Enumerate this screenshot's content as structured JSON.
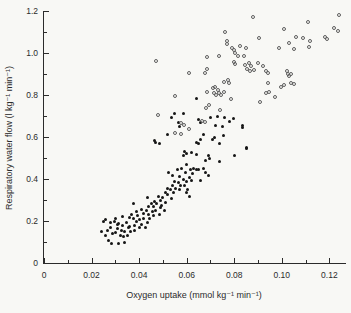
{
  "figure": {
    "background": "#f8f8f5",
    "axis_color": "#2b2b2b",
    "text_color": "#2b2b2b"
  },
  "chart_data": {
    "type": "scatter",
    "title": "",
    "xlabel": "Oxygen uptake (mmol kg⁻¹ min⁻¹)",
    "ylabel": "Respiratory water flow (l kg⁻¹ min⁻¹)",
    "grid": false,
    "legend": "none",
    "axes": {
      "x": {
        "min": 0,
        "max": 0.127,
        "major_ticks": [
          {
            "v": 0,
            "t": "0"
          },
          {
            "v": 0.02,
            "t": "0.02"
          },
          {
            "v": 0.04,
            "t": "0.04"
          },
          {
            "v": 0.06,
            "t": "0.06"
          },
          {
            "v": 0.08,
            "t": "0.08"
          },
          {
            "v": 0.1,
            "t": "0.10"
          },
          {
            "v": 0.12,
            "t": "0.12"
          }
        ],
        "minor_ticks": [
          0.01,
          0.03,
          0.05,
          0.07,
          0.09,
          0.11
        ]
      },
      "y": {
        "min": 0,
        "max": 1.2,
        "major_ticks": [
          {
            "v": 0,
            "t": "0"
          },
          {
            "v": 0.2,
            "t": "0.2"
          },
          {
            "v": 0.4,
            "t": "0.4"
          },
          {
            "v": 0.6,
            "t": "0.6"
          },
          {
            "v": 0.8,
            "t": "0.8"
          },
          {
            "v": 1.0,
            "t": "1.0"
          },
          {
            "v": 1.2,
            "t": "1.2"
          }
        ],
        "minor_ticks": [
          0.1,
          0.3,
          0.5,
          0.7,
          0.9,
          1.1
        ]
      }
    },
    "series": [
      {
        "name": "filled-circles",
        "marker": "filled-circle",
        "color": "#161616",
        "points": [
          [
            0.024,
            0.15
          ],
          [
            0.025,
            0.2
          ],
          [
            0.026,
            0.13
          ],
          [
            0.026,
            0.205
          ],
          [
            0.0265,
            0.155
          ],
          [
            0.027,
            0.105
          ],
          [
            0.028,
            0.17
          ],
          [
            0.028,
            0.195
          ],
          [
            0.0285,
            0.095
          ],
          [
            0.029,
            0.14
          ],
          [
            0.0295,
            0.2
          ],
          [
            0.03,
            0.21
          ],
          [
            0.03,
            0.143
          ],
          [
            0.031,
            0.165
          ],
          [
            0.031,
            0.185
          ],
          [
            0.0315,
            0.19
          ],
          [
            0.0315,
            0.095
          ],
          [
            0.032,
            0.133
          ],
          [
            0.0325,
            0.157
          ],
          [
            0.033,
            0.22
          ],
          [
            0.033,
            0.18
          ],
          [
            0.0335,
            0.125
          ],
          [
            0.034,
            0.098
          ],
          [
            0.034,
            0.152
          ],
          [
            0.0345,
            0.195
          ],
          [
            0.035,
            0.133
          ],
          [
            0.0355,
            0.167
          ],
          [
            0.036,
            0.215
          ],
          [
            0.036,
            0.175
          ],
          [
            0.0365,
            0.148
          ],
          [
            0.037,
            0.233
          ],
          [
            0.0375,
            0.21
          ],
          [
            0.0375,
            0.285
          ],
          [
            0.038,
            0.18
          ],
          [
            0.038,
            0.157
          ],
          [
            0.039,
            0.243
          ],
          [
            0.039,
            0.2
          ],
          [
            0.0395,
            0.225
          ],
          [
            0.04,
            0.17
          ],
          [
            0.04,
            0.205
          ],
          [
            0.041,
            0.257
          ],
          [
            0.041,
            0.185
          ],
          [
            0.042,
            0.238
          ],
          [
            0.042,
            0.214
          ],
          [
            0.0425,
            0.167
          ],
          [
            0.043,
            0.252
          ],
          [
            0.0435,
            0.195
          ],
          [
            0.0435,
            0.314
          ],
          [
            0.044,
            0.229
          ],
          [
            0.044,
            0.267
          ],
          [
            0.0445,
            0.21
          ],
          [
            0.045,
            0.281
          ],
          [
            0.0455,
            0.243
          ],
          [
            0.046,
            0.224
          ],
          [
            0.046,
            0.271
          ],
          [
            0.0465,
            0.295
          ],
          [
            0.047,
            0.252
          ],
          [
            0.0475,
            0.281
          ],
          [
            0.048,
            0.319
          ],
          [
            0.0485,
            0.233
          ],
          [
            0.049,
            0.262
          ],
          [
            0.049,
            0.3
          ],
          [
            0.0495,
            0.276
          ],
          [
            0.05,
            0.314
          ],
          [
            0.0505,
            0.252
          ],
          [
            0.051,
            0.338
          ],
          [
            0.051,
            0.29
          ],
          [
            0.052,
            0.357
          ],
          [
            0.052,
            0.324
          ],
          [
            0.0525,
            0.433
          ],
          [
            0.053,
            0.348
          ],
          [
            0.0535,
            0.305
          ],
          [
            0.054,
            0.367
          ],
          [
            0.054,
            0.419
          ],
          [
            0.0545,
            0.338
          ],
          [
            0.055,
            0.39
          ],
          [
            0.0555,
            0.357
          ],
          [
            0.056,
            0.443
          ],
          [
            0.0565,
            0.381
          ],
          [
            0.057,
            0.348
          ],
          [
            0.057,
            0.414
          ],
          [
            0.0575,
            0.367
          ],
          [
            0.058,
            0.452
          ],
          [
            0.0585,
            0.4
          ],
          [
            0.059,
            0.533
          ],
          [
            0.059,
            0.367
          ],
          [
            0.0595,
            0.429
          ],
          [
            0.06,
            0.467
          ],
          [
            0.06,
            0.386
          ],
          [
            0.0605,
            0.352
          ],
          [
            0.061,
            0.405
          ],
          [
            0.0615,
            0.443
          ],
          [
            0.062,
            0.524
          ],
          [
            0.062,
            0.395
          ],
          [
            0.0625,
            0.424
          ],
          [
            0.063,
            0.452
          ],
          [
            0.06,
            0.338
          ],
          [
            0.061,
            0.319
          ],
          [
            0.064,
            0.576
          ],
          [
            0.065,
            0.571
          ],
          [
            0.066,
            0.586
          ],
          [
            0.071,
            0.586
          ],
          [
            0.074,
            0.571
          ],
          [
            0.085,
            0.552
          ],
          [
            0.064,
            0.519
          ],
          [
            0.069,
            0.51
          ],
          [
            0.0695,
            0.5
          ],
          [
            0.068,
            0.49
          ],
          [
            0.08,
            0.514
          ],
          [
            0.074,
            0.481
          ],
          [
            0.064,
            0.443
          ],
          [
            0.065,
            0.443
          ],
          [
            0.067,
            0.452
          ],
          [
            0.068,
            0.433
          ],
          [
            0.069,
            0.419
          ],
          [
            0.066,
            0.395
          ],
          [
            0.064,
            0.785
          ],
          [
            0.055,
            0.714
          ],
          [
            0.0585,
            0.71
          ],
          [
            0.07,
            0.695
          ],
          [
            0.073,
            0.7
          ],
          [
            0.076,
            0.695
          ],
          [
            0.0795,
            0.69
          ],
          [
            0.072,
            0.657
          ],
          [
            0.075,
            0.648
          ],
          [
            0.067,
            0.61
          ],
          [
            0.0715,
            0.6
          ],
          [
            0.0755,
            0.605
          ],
          [
            0.052,
            0.61
          ],
          [
            0.0465,
            0.581
          ],
          [
            0.047,
            0.576
          ],
          [
            0.0485,
            0.571
          ],
          [
            0.0535,
            0.695
          ],
          [
            0.0565,
            0.667
          ],
          [
            0.057,
            0.648
          ],
          [
            0.0835,
            0.643
          ],
          [
            0.085,
            0.546
          ],
          [
            0.078,
            0.676
          ],
          [
            0.065,
            0.681
          ],
          [
            0.066,
            0.671
          ],
          [
            0.0835,
            0.657
          ],
          [
            0.0585,
            0.514
          ],
          [
            0.0598,
            0.522
          ]
        ]
      },
      {
        "name": "open-circles",
        "marker": "open-circle",
        "color": "#5e5e5e",
        "points": [
          [
            0.088,
            1.171
          ],
          [
            0.124,
            1.181
          ],
          [
            0.111,
            1.148
          ],
          [
            0.101,
            1.114
          ],
          [
            0.122,
            1.119
          ],
          [
            0.1235,
            1.105
          ],
          [
            0.0905,
            1.071
          ],
          [
            0.106,
            1.076
          ],
          [
            0.109,
            1.071
          ],
          [
            0.118,
            1.076
          ],
          [
            0.119,
            1.067
          ],
          [
            0.103,
            1.048
          ],
          [
            0.112,
            1.057
          ],
          [
            0.0825,
            1.033
          ],
          [
            0.085,
            1.024
          ],
          [
            0.08,
            1.014
          ],
          [
            0.099,
            1.024
          ],
          [
            0.105,
            1.019
          ],
          [
            0.1115,
            1.029
          ],
          [
            0.0815,
            0.986
          ],
          [
            0.084,
            0.986
          ],
          [
            0.08,
            0.957
          ],
          [
            0.0685,
            0.981
          ],
          [
            0.0735,
            0.986
          ],
          [
            0.076,
            1.1
          ],
          [
            0.077,
            1.057
          ],
          [
            0.077,
            1.043
          ],
          [
            0.079,
            1.024
          ],
          [
            0.0805,
            1.0
          ],
          [
            0.0685,
            0.924
          ],
          [
            0.047,
            0.962
          ],
          [
            0.0805,
            0.948
          ],
          [
            0.0845,
            0.943
          ],
          [
            0.086,
            0.952
          ],
          [
            0.087,
            0.938
          ],
          [
            0.0855,
            0.924
          ],
          [
            0.0865,
            0.914
          ],
          [
            0.0885,
            0.919
          ],
          [
            0.09,
            0.952
          ],
          [
            0.092,
            0.938
          ],
          [
            0.094,
            0.905
          ],
          [
            0.102,
            0.914
          ],
          [
            0.1025,
            0.902
          ],
          [
            0.104,
            0.898
          ],
          [
            0.103,
            0.89
          ],
          [
            0.104,
            0.857
          ],
          [
            0.105,
            0.852
          ],
          [
            0.094,
            0.857
          ],
          [
            0.0995,
            0.838
          ],
          [
            0.101,
            0.848
          ],
          [
            0.0935,
            0.81
          ],
          [
            0.0945,
            0.814
          ],
          [
            0.097,
            0.79
          ],
          [
            0.091,
            0.767
          ],
          [
            0.061,
            0.905
          ],
          [
            0.0675,
            0.905
          ],
          [
            0.0755,
            0.862
          ],
          [
            0.0775,
            0.871
          ],
          [
            0.078,
            0.857
          ],
          [
            0.071,
            0.833
          ],
          [
            0.072,
            0.838
          ],
          [
            0.073,
            0.824
          ],
          [
            0.0715,
            0.81
          ],
          [
            0.0735,
            0.81
          ],
          [
            0.0725,
            0.8
          ],
          [
            0.0745,
            0.8
          ],
          [
            0.0755,
            0.814
          ],
          [
            0.0685,
            0.814
          ],
          [
            0.0785,
            0.781
          ],
          [
            0.0695,
            0.752
          ],
          [
            0.074,
            0.729
          ],
          [
            0.068,
            0.738
          ],
          [
            0.055,
            0.795
          ],
          [
            0.048,
            0.705
          ],
          [
            0.0665,
            0.678
          ],
          [
            0.0675,
            0.672
          ],
          [
            0.0575,
            0.667
          ],
          [
            0.059,
            0.657
          ],
          [
            0.055,
            0.617
          ],
          [
            0.0575,
            0.614
          ],
          [
            0.061,
            0.64
          ],
          [
            0.0935,
            0.916
          ]
        ]
      }
    ]
  }
}
